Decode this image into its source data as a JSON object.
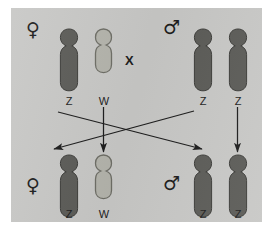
{
  "figure": {
    "background_color": "#ffffff",
    "panel_color": "#c8c8c6"
  },
  "colors": {
    "z_chromosome_fill": "#5c5c58",
    "z_chromosome_stroke": "#3c3c39",
    "w_chromosome_fill": "#b4b4ac",
    "w_chromosome_stroke": "#6e6e66",
    "ink": "#1d1d1d"
  },
  "cross_symbol": {
    "label": "X",
    "name": "cross-mating-symbol"
  },
  "parents": {
    "female": {
      "symbol": "♀",
      "symbol_name": "female-sex-symbol",
      "chromosomes": [
        {
          "label": "Z",
          "type": "Z",
          "length": "long",
          "color": "#5c5c58"
        },
        {
          "label": "W",
          "type": "W",
          "length": "short",
          "color": "#b4b4ac"
        }
      ]
    },
    "male": {
      "symbol": "♂",
      "symbol_name": "male-sex-symbol",
      "chromosomes": [
        {
          "label": "Z",
          "type": "Z",
          "length": "long",
          "color": "#5c5c58"
        },
        {
          "label": "Z",
          "type": "Z",
          "length": "long",
          "color": "#5c5c58"
        }
      ]
    }
  },
  "offspring": {
    "female": {
      "symbol": "♀",
      "symbol_name": "female-sex-symbol",
      "chromosomes": [
        {
          "label": "Z",
          "type": "Z",
          "length": "long",
          "color": "#5c5c58"
        },
        {
          "label": "W",
          "type": "W",
          "length": "short",
          "color": "#b4b4ac"
        }
      ]
    },
    "male": {
      "symbol": "♂",
      "symbol_name": "male-sex-symbol",
      "chromosomes": [
        {
          "label": "Z",
          "type": "Z",
          "length": "long",
          "color": "#5c5c58"
        },
        {
          "label": "Z",
          "type": "Z",
          "length": "long",
          "color": "#5c5c58"
        }
      ]
    }
  },
  "inheritance_arrows": [
    {
      "name": "arrow-maternal-z-to-male-offspring",
      "from": "female-Z",
      "to": "male-offspring-Z",
      "style": "diagonal"
    },
    {
      "name": "arrow-paternal-z-to-female-offspring",
      "from": "male-Z-left",
      "to": "female-offspring-Z",
      "style": "diagonal"
    },
    {
      "name": "arrow-maternal-w-to-female-offspring",
      "from": "female-W",
      "to": "female-offspring-W",
      "style": "vertical"
    },
    {
      "name": "arrow-paternal-z-to-male-offspring",
      "from": "male-Z-right",
      "to": "male-offspring-Z",
      "style": "vertical"
    }
  ]
}
